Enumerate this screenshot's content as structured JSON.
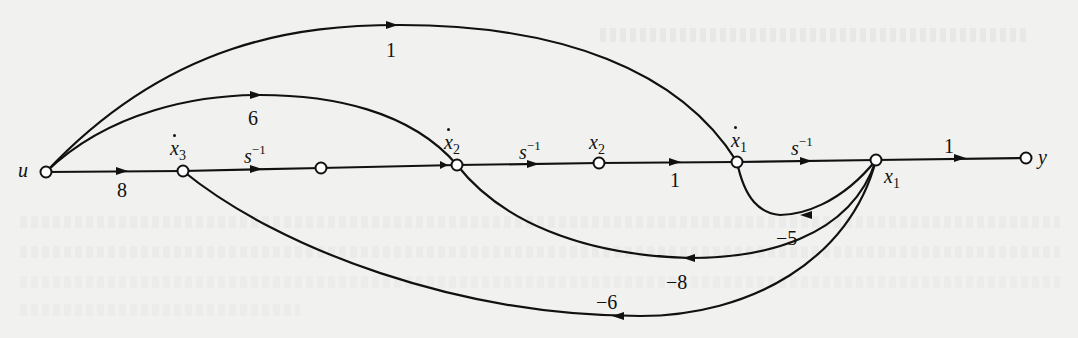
{
  "figure": {
    "type": "signal-flow-graph",
    "background_color": "#f1f1ef",
    "ink_color": "#111111"
  },
  "nodes": [
    {
      "id": "u",
      "label": "u",
      "x": 46,
      "y": 172
    },
    {
      "id": "x3dot",
      "label": "x3",
      "dot": true,
      "x": 183,
      "y": 171
    },
    {
      "id": "x3",
      "label": "",
      "x": 321,
      "y": 168
    },
    {
      "id": "x2dot",
      "label": "x2",
      "dot": true,
      "x": 457,
      "y": 165
    },
    {
      "id": "x2",
      "label": "x2",
      "x": 599,
      "y": 163
    },
    {
      "id": "x1dot",
      "label": "x1",
      "dot": true,
      "x": 737,
      "y": 162
    },
    {
      "id": "x1",
      "label": "x1",
      "x": 876,
      "y": 160
    },
    {
      "id": "y",
      "label": "y",
      "x": 1026,
      "y": 158
    }
  ],
  "labels": {
    "u": "u",
    "x3dot_base": "x",
    "x3dot_sub": "3",
    "x2dot_base": "x",
    "x2dot_sub": "2",
    "x2_base": "x",
    "x2_sub": "2",
    "x1dot_base": "x",
    "x1dot_sub": "1",
    "x1_base": "x",
    "x1_sub": "1",
    "y": "y"
  },
  "edges": [
    {
      "from": "u",
      "to": "x3dot",
      "gain": "8"
    },
    {
      "from": "x3dot",
      "to": "x3",
      "gain_base": "s",
      "gain_sup": "−1"
    },
    {
      "from": "x3",
      "to": "x2dot",
      "gain": ""
    },
    {
      "from": "x2dot",
      "to": "x2",
      "gain_base": "s",
      "gain_sup": "−1"
    },
    {
      "from": "x2",
      "to": "x1dot",
      "gain": "1"
    },
    {
      "from": "x1dot",
      "to": "x1",
      "gain_base": "s",
      "gain_sup": "−1"
    },
    {
      "from": "x1",
      "to": "y",
      "gain": "1"
    },
    {
      "from": "u",
      "to": "x1dot",
      "gain": "1",
      "kind": "feedforward"
    },
    {
      "from": "u",
      "to": "x2dot",
      "gain": "6",
      "kind": "feedforward"
    },
    {
      "from": "x1",
      "to": "x1dot",
      "gain": "−5",
      "kind": "feedback"
    },
    {
      "from": "x1",
      "to": "x2dot",
      "gain": "−8",
      "kind": "feedback"
    },
    {
      "from": "x1",
      "to": "x3dot",
      "gain": "−6",
      "kind": "feedback"
    }
  ],
  "gains": {
    "u_x3dot": "8",
    "x3dot_x3": {
      "base": "s",
      "sup": "−1"
    },
    "x2dot_x2": {
      "base": "s",
      "sup": "−1"
    },
    "x2_x1dot": "1",
    "x1dot_x1": {
      "base": "s",
      "sup": "−1"
    },
    "x1_y": "1",
    "ff_u_x1dot": "1",
    "ff_u_x2dot": "6",
    "fb_x1_x1dot": "−5",
    "fb_x1_x2dot": "−8",
    "fb_x1_x3dot": "−6"
  }
}
